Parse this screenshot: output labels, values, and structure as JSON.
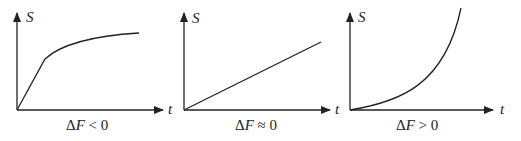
{
  "panels": [
    {
      "y_label": "S",
      "x_label": "t",
      "caption_delta": "Δ",
      "caption_var": "F",
      "caption_rel": " < 0",
      "shape": "linear-then-saturating"
    },
    {
      "y_label": "S",
      "x_label": "t",
      "caption_delta": "Δ",
      "caption_var": "F",
      "caption_rel": " ≈ 0",
      "shape": "linear"
    },
    {
      "y_label": "S",
      "x_label": "t",
      "caption_delta": "Δ",
      "caption_var": "F",
      "caption_rel": " > 0",
      "shape": "exponential"
    }
  ]
}
